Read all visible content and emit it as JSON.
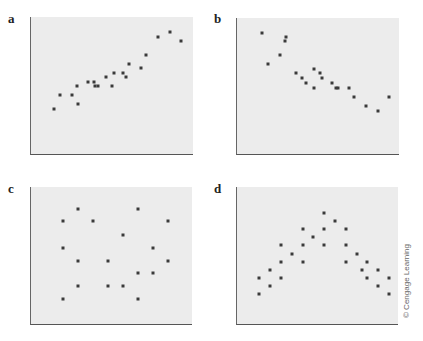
{
  "chart_data": [
    {
      "type": "scatter",
      "label": "a",
      "title": "",
      "xlabel": "",
      "ylabel": "",
      "grid": false,
      "description": "Positive linear correlation",
      "plot_box": {
        "left": 30,
        "top": 17,
        "width": 163,
        "height": 138
      },
      "points": [
        [
          53,
          109
        ],
        [
          59,
          95
        ],
        [
          71,
          95
        ],
        [
          76,
          86
        ],
        [
          77,
          104
        ],
        [
          87,
          82
        ],
        [
          93,
          82
        ],
        [
          94,
          86
        ],
        [
          97,
          86
        ],
        [
          105,
          77
        ],
        [
          111,
          86
        ],
        [
          113,
          73
        ],
        [
          122,
          73
        ],
        [
          125,
          77
        ],
        [
          128,
          64
        ],
        [
          140,
          68
        ],
        [
          145,
          55
        ],
        [
          157,
          37
        ],
        [
          169,
          32
        ],
        [
          180,
          41
        ]
      ]
    },
    {
      "type": "scatter",
      "label": "b",
      "title": "",
      "xlabel": "",
      "ylabel": "",
      "grid": false,
      "description": "Negative linear correlation",
      "plot_box": {
        "left": 236,
        "top": 18,
        "width": 163,
        "height": 137
      },
      "points": [
        [
          261,
          33
        ],
        [
          267,
          64
        ],
        [
          279,
          55
        ],
        [
          284,
          41
        ],
        [
          285,
          37
        ],
        [
          295,
          73
        ],
        [
          301,
          78
        ],
        [
          305,
          83
        ],
        [
          313,
          88
        ],
        [
          313,
          69
        ],
        [
          319,
          73
        ],
        [
          321,
          78
        ],
        [
          331,
          83
        ],
        [
          335,
          88
        ],
        [
          337,
          88
        ],
        [
          348,
          88
        ],
        [
          353,
          97
        ],
        [
          365,
          106
        ],
        [
          377,
          111
        ],
        [
          388,
          97
        ]
      ]
    },
    {
      "type": "scatter",
      "label": "c",
      "title": "",
      "xlabel": "",
      "ylabel": "",
      "grid": false,
      "description": "No correlation",
      "plot_box": {
        "left": 30,
        "top": 187,
        "width": 162,
        "height": 138
      },
      "points": [
        [
          62,
          221
        ],
        [
          77,
          209
        ],
        [
          92,
          221
        ],
        [
          122,
          235
        ],
        [
          137,
          209
        ],
        [
          167,
          221
        ],
        [
          62,
          248
        ],
        [
          77,
          261
        ],
        [
          107,
          261
        ],
        [
          152,
          248
        ],
        [
          167,
          261
        ],
        [
          137,
          273
        ],
        [
          152,
          273
        ],
        [
          77,
          286
        ],
        [
          107,
          286
        ],
        [
          122,
          286
        ],
        [
          62,
          299
        ],
        [
          137,
          299
        ]
      ]
    },
    {
      "type": "scatter",
      "label": "d",
      "title": "",
      "xlabel": "",
      "ylabel": "",
      "grid": false,
      "description": "Nonlinear (inverted-V) relationship",
      "plot_box": {
        "left": 236,
        "top": 187,
        "width": 162,
        "height": 138
      },
      "points": [
        [
          258,
          294
        ],
        [
          258,
          278
        ],
        [
          269,
          286
        ],
        [
          269,
          270
        ],
        [
          280,
          278
        ],
        [
          280,
          262
        ],
        [
          280,
          245
        ],
        [
          291,
          254
        ],
        [
          302,
          262
        ],
        [
          302,
          229
        ],
        [
          302,
          245
        ],
        [
          312,
          237
        ],
        [
          323,
          213
        ],
        [
          323,
          229
        ],
        [
          323,
          245
        ],
        [
          334,
          221
        ],
        [
          345,
          245
        ],
        [
          345,
          229
        ],
        [
          345,
          262
        ],
        [
          356,
          254
        ],
        [
          361,
          270
        ],
        [
          366,
          262
        ],
        [
          366,
          278
        ],
        [
          377,
          286
        ],
        [
          377,
          270
        ],
        [
          388,
          278
        ],
        [
          388,
          294
        ]
      ]
    }
  ],
  "panels": {
    "a": {
      "label": "a"
    },
    "b": {
      "label": "b"
    },
    "c": {
      "label": "c"
    },
    "d": {
      "label": "d"
    }
  },
  "credit": "© Cengage Learning",
  "colors": {
    "plot_background": "#ececec",
    "marker": "#3a3a3a",
    "axis": "#555555"
  }
}
